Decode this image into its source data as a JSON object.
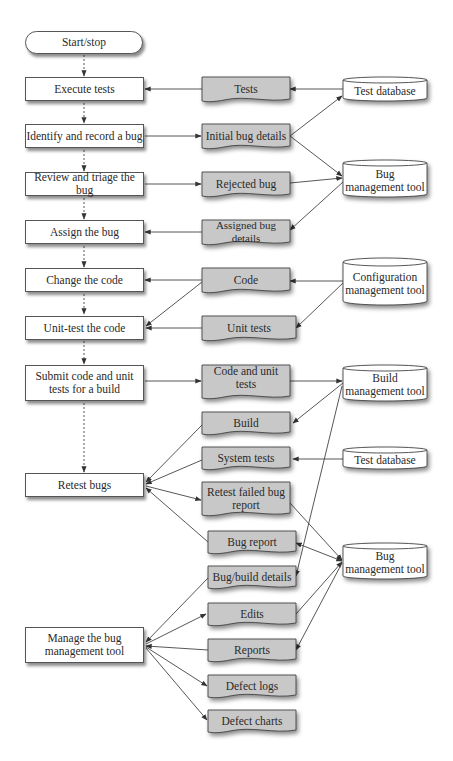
{
  "diagram": {
    "type": "flowchart",
    "colors": {
      "process_fill": "#ffffff",
      "document_fill": "#c8c8c8",
      "datastore_fill": "#ffffff",
      "stroke": "#444444"
    },
    "process": {
      "start_stop": "Start/stop",
      "execute_tests": "Execute tests",
      "identify_record": "Identify and record a bug",
      "review_triage": "Review and triage the bug",
      "assign_bug": "Assign the bug",
      "change_code": "Change the code",
      "unit_test": "Unit-test the code",
      "submit_line1": "Submit code and unit",
      "submit_line2": "tests for a build",
      "retest_bugs": "Retest bugs",
      "manage_line1": "Manage the bug",
      "manage_line2": "management tool"
    },
    "documents": {
      "tests": "Tests",
      "initial_bug_details": "Initial bug  details",
      "rejected_bug": "Rejected bug",
      "assigned_bug_details": "Assigned bug details",
      "code": "Code",
      "unit_tests": "Unit tests",
      "code_and_unit_tests": "Code and unit tests",
      "build": "Build",
      "system_tests": "System tests",
      "retest_failed_line1": "Retest failed bug",
      "retest_failed_line2": "report",
      "bug_report": "Bug report",
      "bug_build_details": "Bug/build details",
      "edits": "Edits",
      "reports": "Reports",
      "defect_logs": "Defect logs",
      "defect_charts": "Defect charts"
    },
    "datastores": {
      "test_database_1": "Test database",
      "bug_mgmt_1_line1": "Bug",
      "bug_mgmt_1_line2": "management tool",
      "config_line1": "Configuration",
      "config_line2": "management tool",
      "build_mgmt_line1": "Build",
      "build_mgmt_line2": "management tool",
      "test_database_2": "Test database",
      "bug_mgmt_2_line1": "Bug",
      "bug_mgmt_2_line2": "management tool"
    }
  }
}
